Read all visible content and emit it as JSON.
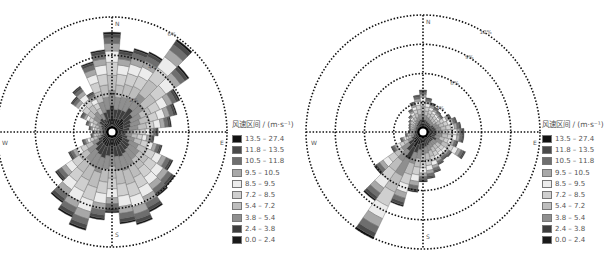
{
  "legend": {
    "title": "风速区间 / (m·s⁻¹)",
    "bins": [
      {
        "label": "13.5 – 27.4",
        "color": "#111111"
      },
      {
        "label": "11.8 – 13.5",
        "color": "#4a4a4a"
      },
      {
        "label": "10.5 – 11.8",
        "color": "#6e6e6e"
      },
      {
        "label": "9.5 – 10.5",
        "color": "#a8a8a8"
      },
      {
        "label": "8.5 – 9.5",
        "color": "#ececec"
      },
      {
        "label": "7.2 – 8.5",
        "color": "#cfcfcf"
      },
      {
        "label": "5.4 – 7.2",
        "color": "#bdbdbd"
      },
      {
        "label": "3.8 – 5.4",
        "color": "#8f8f8f"
      },
      {
        "label": "2.4 – 3.8",
        "color": "#3d3d3d"
      },
      {
        "label": "0.0 – 2.4",
        "color": "#1a1a1a"
      }
    ]
  },
  "chart_data": [
    {
      "type": "wind_rose",
      "title": "",
      "directions": [
        "N",
        "E",
        "S",
        "W"
      ],
      "ring_labels": [
        "2%",
        "4%",
        "6%"
      ],
      "rings": [
        2,
        4,
        6
      ],
      "rmax_pct": 6,
      "sector_width_deg": 10,
      "sector_centers_deg": [
        0,
        10,
        20,
        30,
        40,
        50,
        60,
        70,
        80,
        90,
        100,
        110,
        120,
        130,
        140,
        150,
        160,
        170,
        180,
        190,
        200,
        210,
        220,
        230,
        240,
        250,
        260,
        270,
        280,
        290,
        300,
        310,
        320,
        330,
        340,
        350
      ],
      "totals_pct": [
        4.9,
        4.0,
        4.2,
        4.3,
        5.6,
        4.6,
        3.6,
        3.2,
        2.8,
        2.1,
        1.9,
        2.4,
        3.2,
        3.7,
        3.8,
        4.3,
        4.7,
        4.5,
        3.9,
        4.3,
        5.0,
        4.6,
        4.2,
        3.3,
        2.2,
        1.3,
        0.8,
        0.7,
        0.9,
        1.1,
        1.5,
        2.3,
        2.6,
        2.0,
        3.5,
        4.0
      ]
    },
    {
      "type": "wind_rose",
      "title": "",
      "directions": [
        "N",
        "E",
        "S",
        "W"
      ],
      "ring_labels": [
        "3%",
        "6%",
        "9%",
        "12%"
      ],
      "rings": [
        3,
        6,
        9,
        12
      ],
      "rmax_pct": 12,
      "sector_width_deg": 10,
      "sector_centers_deg": [
        0,
        10,
        20,
        30,
        40,
        50,
        60,
        70,
        80,
        90,
        100,
        110,
        120,
        130,
        140,
        150,
        160,
        170,
        180,
        190,
        200,
        210,
        220,
        230,
        240,
        250,
        260,
        270,
        280,
        290,
        300,
        310,
        320,
        330,
        340,
        350
      ],
      "totals_pct": [
        3.7,
        2.9,
        2.5,
        2.2,
        2.0,
        1.9,
        2.6,
        3.0,
        3.3,
        3.6,
        3.6,
        3.1,
        4.2,
        3.0,
        2.9,
        3.1,
        3.7,
        4.2,
        4.5,
        5.6,
        7.3,
        11.5,
        8.0,
        5.5,
        3.0,
        1.8,
        1.2,
        0.9,
        0.8,
        0.9,
        1.0,
        1.2,
        1.5,
        2.0,
        2.6,
        3.2
      ]
    }
  ]
}
